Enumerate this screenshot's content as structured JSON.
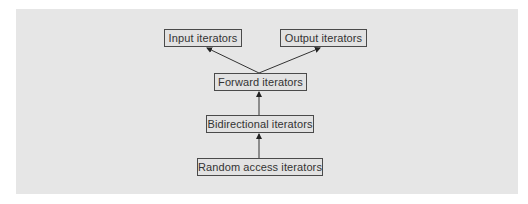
{
  "diagram": {
    "nodes": [
      {
        "id": "input",
        "label": "Input iterators",
        "x": 164,
        "y": 29,
        "w": 76
      },
      {
        "id": "output",
        "label": "Output iterators",
        "x": 280,
        "y": 29,
        "w": 85
      },
      {
        "id": "forward",
        "label": "Forward iterators",
        "x": 214,
        "y": 73,
        "w": 91
      },
      {
        "id": "bidirectional",
        "label": "Bidirectional iterators",
        "x": 206,
        "y": 115,
        "w": 106
      },
      {
        "id": "random",
        "label": "Random access iterators",
        "x": 197,
        "y": 158,
        "w": 124
      }
    ],
    "edges": [
      {
        "from": "forward",
        "to": "input"
      },
      {
        "from": "forward",
        "to": "output"
      },
      {
        "from": "bidirectional",
        "to": "forward"
      },
      {
        "from": "random",
        "to": "bidirectional"
      }
    ],
    "colors": {
      "panel": "#e6e6e6",
      "border": "#4a4a4a",
      "text": "#333333"
    }
  }
}
